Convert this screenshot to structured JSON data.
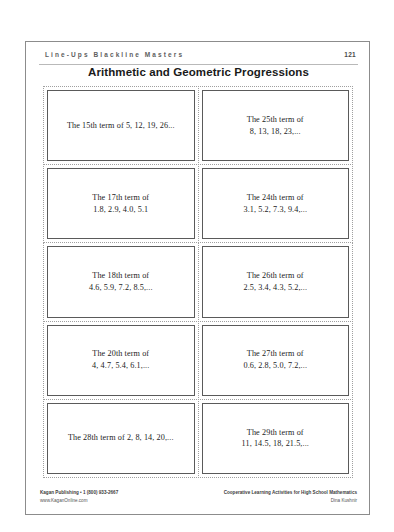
{
  "document": {
    "running_head": "Line-Ups Blackline Masters",
    "page_number": "121",
    "title": "Arithmetic and Geometric Progressions"
  },
  "cards": [
    {
      "line1": "The 15th term of 5, 12, 19, 26...",
      "line2": ""
    },
    {
      "line1": "The 25th term of",
      "line2": "8, 13, 18, 23,..."
    },
    {
      "line1": "The 17th term of",
      "line2": "1.8, 2.9, 4.0, 5.1"
    },
    {
      "line1": "The 24th term of",
      "line2": "3.1, 5.2, 7.3, 9.4,..."
    },
    {
      "line1": "The 18th term of",
      "line2": "4.6, 5.9, 7.2, 8.5,..."
    },
    {
      "line1": "The 26th term of",
      "line2": "2.5, 3.4, 4.3, 5.2,..."
    },
    {
      "line1": "The 20th term of",
      "line2": "4, 4.7, 5.4, 6.1,..."
    },
    {
      "line1": "The 27th term of",
      "line2": "0.6, 2.8, 5.0, 7.2,..."
    },
    {
      "line1": "The 28th term of 2, 8, 14, 20,...",
      "line2": ""
    },
    {
      "line1": "The 29th term of",
      "line2": "11, 14.5, 18, 21.5,..."
    }
  ],
  "footer": {
    "publisher": "Kagan Publishing • 1 (800) 933-2667",
    "website": "www.KaganOnline.com",
    "book_title": "Cooperative Learning Activities for High School Mathematics",
    "author": "Dina Kushnir"
  }
}
